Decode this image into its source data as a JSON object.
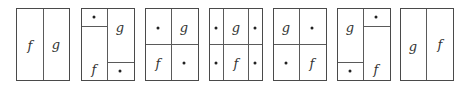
{
  "labels": {
    "f": "f",
    "g": "g"
  },
  "panels": [
    {
      "id": 1,
      "description": "two columns: f | g"
    },
    {
      "id": 2,
      "description": "left column: small top cell (*) over f; right column: g over small bottom cell (*)"
    },
    {
      "id": 3,
      "description": "2x2 grid: * g / f *"
    },
    {
      "id": 4,
      "description": "3 columns x 2 rows: * g * / * f *"
    },
    {
      "id": 5,
      "description": "2x2 grid: g * / * f"
    },
    {
      "id": 6,
      "description": "left column: g over small bottom cell (*); right column: small top cell (*) over f"
    },
    {
      "id": 7,
      "description": "two columns: g | f"
    }
  ],
  "colors": {
    "line": "#4a4a4a",
    "text": "#333333",
    "background": "#ffffff"
  }
}
